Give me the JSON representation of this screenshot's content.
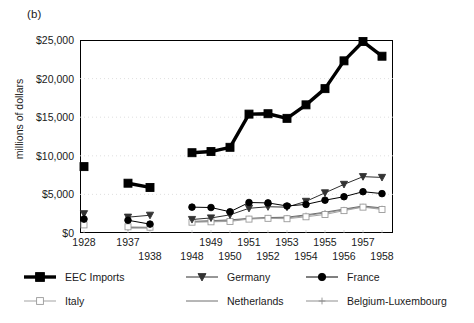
{
  "panel": {
    "label": "(b)"
  },
  "axes": {
    "ylabel": "millions of dollars",
    "y_ticks": [
      "$0",
      "$5,000",
      "$10,000",
      "$15,000",
      "$20,000",
      "$25,000"
    ],
    "x_ticks": [
      "1928",
      "1937",
      "1938",
      "1948",
      "1949",
      "1950",
      "1951",
      "1952",
      "1953",
      "1954",
      "1955",
      "1956",
      "1957",
      "1958"
    ]
  },
  "legend": {
    "items": [
      {
        "label": "EEC Imports",
        "marker": "filled-square",
        "color": "#000000",
        "lw": "thick"
      },
      {
        "label": "Germany",
        "marker": "filled-triangle-down",
        "color": "#3a3a3a",
        "lw": "thin"
      },
      {
        "label": "France",
        "marker": "filled-circle",
        "color": "#000000",
        "lw": "thin"
      },
      {
        "label": "Italy",
        "marker": "open-square",
        "color": "#9a9a9a",
        "lw": "thin"
      },
      {
        "label": "Netherlands",
        "marker": "none",
        "color": "#707070",
        "lw": "thin"
      },
      {
        "label": "Belgium-Luxembourg",
        "marker": "plus",
        "color": "#8a8a8a",
        "lw": "thin"
      }
    ]
  },
  "chart_data": {
    "type": "line",
    "title": "",
    "subtitle": "",
    "xlabel": "",
    "ylabel": "millions of dollars",
    "ylim": [
      0,
      25000
    ],
    "ytick_step": 5000,
    "grid": "horizontal-dotted",
    "legend_position": "below-plot",
    "note": "Years 1928 and 1937-1938 are plotted as separate clusters with a break before 1948; 1928 markers are isolated points with no connecting segments.",
    "x": [
      "1928",
      "1937",
      "1938",
      "1948",
      "1949",
      "1950",
      "1951",
      "1952",
      "1953",
      "1954",
      "1955",
      "1956",
      "1957",
      "1958"
    ],
    "series": [
      {
        "name": "EEC Imports",
        "values": [
          8600,
          6450,
          5900,
          10400,
          10550,
          11100,
          15400,
          15450,
          14850,
          16600,
          18700,
          22300,
          24800,
          22900
        ],
        "segments": [
          [
            "1928"
          ],
          [
            "1937",
            "1938"
          ],
          [
            "1948",
            "1949",
            "1950",
            "1951",
            "1952",
            "1953",
            "1954",
            "1955",
            "1956",
            "1957",
            "1958"
          ]
        ]
      },
      {
        "name": "Germany",
        "values": [
          2500,
          2050,
          2300,
          1750,
          1950,
          2350,
          3200,
          3400,
          3350,
          4100,
          5200,
          6300,
          7300,
          7200
        ],
        "segments": [
          [
            "1928"
          ],
          [
            "1937",
            "1938"
          ],
          [
            "1948",
            "1949",
            "1950",
            "1951",
            "1952",
            "1953",
            "1954",
            "1955",
            "1956",
            "1957",
            "1958"
          ]
        ]
      },
      {
        "name": "France",
        "values": [
          1800,
          1650,
          1150,
          3350,
          3300,
          2750,
          3950,
          3900,
          3500,
          3700,
          4250,
          4700,
          5350,
          5100
        ],
        "segments": [
          [
            "1928"
          ],
          [
            "1937",
            "1938"
          ],
          [
            "1948",
            "1949",
            "1950",
            "1951",
            "1952",
            "1953",
            "1954",
            "1955",
            "1956",
            "1957",
            "1958"
          ]
        ]
      },
      {
        "name": "Italy",
        "values": [
          1050,
          800,
          750,
          1400,
          1450,
          1500,
          1800,
          1900,
          1850,
          2100,
          2400,
          2900,
          3350,
          3050
        ],
        "segments": [
          [
            "1928"
          ],
          [
            "1937",
            "1938"
          ],
          [
            "1948",
            "1949",
            "1950",
            "1951",
            "1952",
            "1953",
            "1954",
            "1955",
            "1956",
            "1957",
            "1958"
          ]
        ]
      },
      {
        "name": "Netherlands",
        "values": [
          null,
          700,
          700,
          1500,
          1600,
          1700,
          1900,
          2000,
          2050,
          2350,
          2700,
          3100,
          3500,
          3250
        ],
        "segments": [
          [
            "1937",
            "1938"
          ],
          [
            "1948",
            "1949",
            "1950",
            "1951",
            "1952",
            "1953",
            "1954",
            "1955",
            "1956",
            "1957",
            "1958"
          ]
        ]
      },
      {
        "name": "Belgium-Luxembourg",
        "values": [
          null,
          650,
          650,
          1450,
          1500,
          1600,
          1850,
          1950,
          1950,
          2250,
          2600,
          3000,
          3400,
          3150
        ],
        "segments": [
          [
            "1937",
            "1938"
          ],
          [
            "1948",
            "1949",
            "1950",
            "1951",
            "1952",
            "1953",
            "1954",
            "1955",
            "1956",
            "1957",
            "1958"
          ]
        ]
      }
    ]
  }
}
